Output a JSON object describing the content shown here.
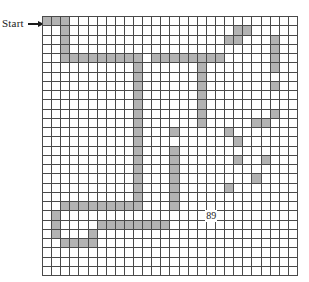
{
  "figure": {
    "type": "grid-lattice-path-diagram",
    "start_label": "Start",
    "arrow_icon": "right-arrow-icon",
    "grid": {
      "columns": 28,
      "rows": 28,
      "cell_px": 9.14,
      "line_color": "#4a4a4a",
      "shaded_color": "#b3b3b3",
      "background_color": "#ffffff"
    },
    "annotations": [
      {
        "text": "89",
        "col": 18,
        "row": 21
      }
    ],
    "shaded_cells": [
      [
        0,
        0
      ],
      [
        0,
        1
      ],
      [
        0,
        2
      ],
      [
        1,
        2
      ],
      [
        1,
        21
      ],
      [
        1,
        22
      ],
      [
        2,
        2
      ],
      [
        2,
        20
      ],
      [
        2,
        21
      ],
      [
        2,
        25
      ],
      [
        3,
        2
      ],
      [
        3,
        25
      ],
      [
        4,
        2
      ],
      [
        4,
        3
      ],
      [
        4,
        4
      ],
      [
        4,
        5
      ],
      [
        4,
        6
      ],
      [
        4,
        7
      ],
      [
        4,
        8
      ],
      [
        4,
        9
      ],
      [
        4,
        10
      ],
      [
        4,
        12
      ],
      [
        4,
        13
      ],
      [
        4,
        14
      ],
      [
        4,
        15
      ],
      [
        4,
        16
      ],
      [
        4,
        17
      ],
      [
        4,
        18
      ],
      [
        4,
        19
      ],
      [
        4,
        25
      ],
      [
        5,
        10
      ],
      [
        5,
        17
      ],
      [
        5,
        25
      ],
      [
        6,
        10
      ],
      [
        6,
        17
      ],
      [
        7,
        10
      ],
      [
        7,
        17
      ],
      [
        7,
        25
      ],
      [
        8,
        10
      ],
      [
        8,
        17
      ],
      [
        9,
        10
      ],
      [
        9,
        17
      ],
      [
        10,
        10
      ],
      [
        10,
        17
      ],
      [
        10,
        25
      ],
      [
        11,
        10
      ],
      [
        11,
        17
      ],
      [
        11,
        23
      ],
      [
        11,
        24
      ],
      [
        12,
        10
      ],
      [
        12,
        14
      ],
      [
        12,
        20
      ],
      [
        13,
        10
      ],
      [
        13,
        21
      ],
      [
        14,
        10
      ],
      [
        14,
        14
      ],
      [
        15,
        10
      ],
      [
        15,
        14
      ],
      [
        15,
        21
      ],
      [
        15,
        24
      ],
      [
        16,
        10
      ],
      [
        16,
        14
      ],
      [
        17,
        10
      ],
      [
        17,
        14
      ],
      [
        17,
        23
      ],
      [
        18,
        10
      ],
      [
        18,
        14
      ],
      [
        18,
        20
      ],
      [
        19,
        10
      ],
      [
        19,
        14
      ],
      [
        20,
        2
      ],
      [
        20,
        3
      ],
      [
        20,
        4
      ],
      [
        20,
        5
      ],
      [
        20,
        6
      ],
      [
        20,
        7
      ],
      [
        20,
        8
      ],
      [
        20,
        9
      ],
      [
        20,
        10
      ],
      [
        20,
        14
      ],
      [
        21,
        1
      ],
      [
        22,
        1
      ],
      [
        22,
        6
      ],
      [
        22,
        7
      ],
      [
        22,
        8
      ],
      [
        22,
        9
      ],
      [
        22,
        10
      ],
      [
        22,
        11
      ],
      [
        22,
        12
      ],
      [
        22,
        13
      ],
      [
        23,
        1
      ],
      [
        23,
        5
      ],
      [
        24,
        2
      ],
      [
        24,
        3
      ],
      [
        24,
        4
      ],
      [
        24,
        5
      ]
    ]
  }
}
